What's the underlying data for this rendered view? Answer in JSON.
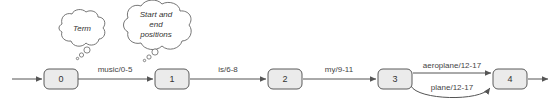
{
  "diagram": {
    "type": "finite-state-automaton",
    "title": "",
    "colors": {
      "state_fill": "#ebebeb",
      "state_stroke": "#5a5a5a",
      "edge": "#555555",
      "text": "#333333",
      "bubble_stroke": "#666666",
      "background": "#ffffff"
    },
    "states": [
      {
        "id": "state-0",
        "label": "0",
        "cx": 61,
        "cy": 79
      },
      {
        "id": "state-1",
        "label": "1",
        "cx": 172,
        "cy": 79
      },
      {
        "id": "state-2",
        "label": "2",
        "cx": 285,
        "cy": 79
      },
      {
        "id": "state-3",
        "label": "3",
        "cx": 395,
        "cy": 79
      },
      {
        "id": "state-4",
        "label": "4",
        "cx": 510,
        "cy": 79
      }
    ],
    "transitions": [
      {
        "id": "edge-start",
        "from": "",
        "to": "state-0",
        "label": ""
      },
      {
        "id": "edge-0-1",
        "from": "state-0",
        "to": "state-1",
        "label": "music/0-5"
      },
      {
        "id": "edge-1-2",
        "from": "state-1",
        "to": "state-2",
        "label": "is/6-8"
      },
      {
        "id": "edge-2-3",
        "from": "state-2",
        "to": "state-3",
        "label": "my/9-11"
      },
      {
        "id": "edge-3-4-top",
        "from": "state-3",
        "to": "state-4",
        "label": "aeroplane/12-17"
      },
      {
        "id": "edge-3-4-curve",
        "from": "state-3",
        "to": "state-4",
        "label": "plane/12-17"
      },
      {
        "id": "edge-end",
        "from": "state-4",
        "to": "",
        "label": ""
      }
    ],
    "annotations": [
      {
        "id": "callout-term",
        "lines": [
          "Term"
        ],
        "cx": 80,
        "cy": 33,
        "points_to": "edge-0-1-label"
      },
      {
        "id": "callout-positions",
        "lines": [
          "Start and",
          "end",
          "positions"
        ],
        "cx": 155,
        "cy": 28,
        "points_to": "edge-0-1-span"
      }
    ]
  }
}
